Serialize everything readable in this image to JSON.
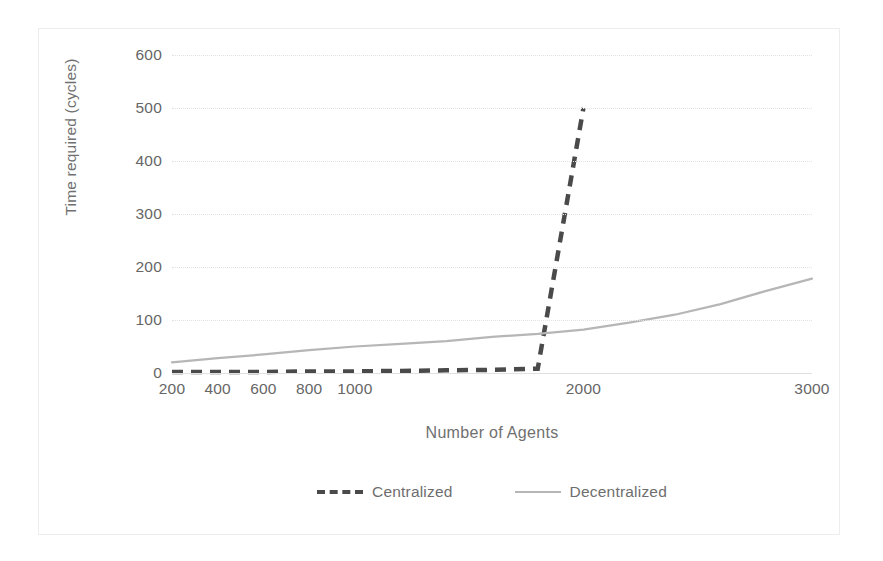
{
  "chart_data": {
    "type": "line",
    "title": "",
    "xlabel": "Number of Agents",
    "ylabel": "Time required (cycles)",
    "x_tick_labels": [
      "200",
      "400",
      "600",
      "800",
      "1000",
      "2000",
      "3000"
    ],
    "categories": [
      200,
      400,
      600,
      800,
      1000,
      1200,
      1400,
      1600,
      1800,
      2000,
      2200,
      2400,
      2600,
      2800,
      3000
    ],
    "ylim": [
      0,
      600
    ],
    "y_ticks": [
      0,
      100,
      200,
      300,
      400,
      500,
      600
    ],
    "y_tick_labels": [
      "0",
      "100",
      "200",
      "300",
      "400",
      "500",
      "600"
    ],
    "grid": true,
    "legend_position": "bottom",
    "series": [
      {
        "name": "Centralized",
        "style": "dashed",
        "color": "#4a4a4a",
        "x": [
          200,
          400,
          600,
          800,
          1000,
          1200,
          1400,
          1600,
          1800,
          2000
        ],
        "values": [
          2,
          2,
          2,
          3,
          3,
          4,
          5,
          6,
          8,
          500
        ]
      },
      {
        "name": "Decentralized",
        "style": "solid",
        "color": "#b6b6b6",
        "x": [
          200,
          400,
          600,
          800,
          1000,
          1200,
          1400,
          1600,
          1800,
          2000,
          2200,
          2400,
          2600,
          2800,
          3000
        ],
        "values": [
          20,
          28,
          35,
          43,
          50,
          55,
          60,
          68,
          74,
          82,
          95,
          110,
          130,
          155,
          178
        ]
      }
    ]
  },
  "legend": {
    "items": [
      {
        "label": "Centralized"
      },
      {
        "label": "Decentralized"
      }
    ]
  },
  "axes": {
    "x_title": "Number of Agents",
    "y_title": "Time required (cycles)"
  }
}
